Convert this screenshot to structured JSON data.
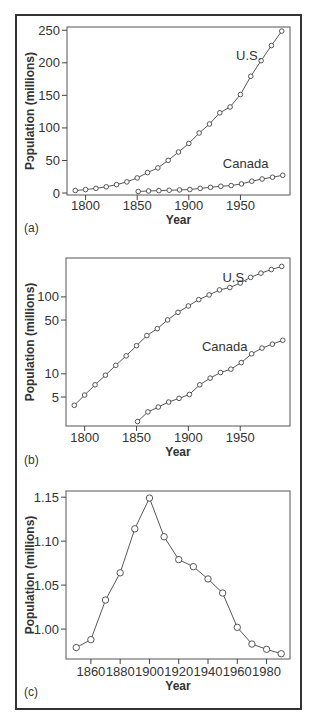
{
  "figure": {
    "panels": [
      "(a)",
      "(b)",
      "(c)"
    ]
  },
  "chart_data": [
    {
      "id": "a",
      "type": "line",
      "panel_label": "(a)",
      "xlabel": "Year",
      "ylabel": "Population (millions)",
      "ylabel_rendered": "Pɔpulation (millions)",
      "yscale": "linear",
      "xlim": [
        1782,
        1998
      ],
      "ylim": [
        -3,
        255
      ],
      "xticks": [
        1800,
        1850,
        1900,
        1950
      ],
      "yticks": [
        0,
        50,
        100,
        150,
        200,
        250
      ],
      "grid": false,
      "series": [
        {
          "name": "U.S.",
          "label_pos": [
            1958,
            205
          ],
          "x": [
            1790,
            1800,
            1810,
            1820,
            1830,
            1840,
            1850,
            1860,
            1870,
            1880,
            1890,
            1900,
            1910,
            1920,
            1930,
            1940,
            1950,
            1960,
            1970,
            1980,
            1990
          ],
          "values": [
            3.9,
            5.3,
            7.2,
            9.6,
            12.9,
            17.1,
            23.2,
            31.4,
            38.6,
            50.2,
            63.0,
            76.2,
            92.2,
            106.0,
            123.2,
            132.2,
            151.3,
            179.3,
            203.3,
            226.5,
            248.7
          ]
        },
        {
          "name": "Canada",
          "label_pos": [
            1955,
            38
          ],
          "x": [
            1851,
            1861,
            1871,
            1881,
            1891,
            1901,
            1911,
            1921,
            1931,
            1941,
            1951,
            1961,
            1971,
            1981,
            1991
          ],
          "values": [
            2.4,
            3.2,
            3.7,
            4.3,
            4.8,
            5.4,
            7.2,
            8.8,
            10.4,
            11.5,
            14.0,
            18.2,
            21.6,
            24.3,
            27.3
          ]
        }
      ]
    },
    {
      "id": "b",
      "type": "line",
      "panel_label": "(b)",
      "xlabel": "Year",
      "ylabel": "Population (millions)",
      "yscale": "log",
      "xlim": [
        1782,
        1998
      ],
      "ylim": [
        2.1,
        320
      ],
      "xticks": [
        1800,
        1850,
        1900,
        1950
      ],
      "yticks": [
        5,
        10,
        50,
        100
      ],
      "grid": false,
      "series": [
        {
          "name": "U.S.",
          "label_pos": [
            1945,
            155
          ],
          "x": [
            1790,
            1800,
            1810,
            1820,
            1830,
            1840,
            1850,
            1860,
            1870,
            1880,
            1890,
            1900,
            1910,
            1920,
            1930,
            1940,
            1950,
            1960,
            1970,
            1980,
            1990
          ],
          "values": [
            3.9,
            5.3,
            7.2,
            9.6,
            12.9,
            17.1,
            23.2,
            31.4,
            38.6,
            50.2,
            63.0,
            76.2,
            92.2,
            106.0,
            123.2,
            132.2,
            151.3,
            179.3,
            203.3,
            226.5,
            248.7
          ]
        },
        {
          "name": "Canada",
          "label_pos": [
            1935,
            20
          ],
          "x": [
            1851,
            1861,
            1871,
            1881,
            1891,
            1901,
            1911,
            1921,
            1931,
            1941,
            1951,
            1961,
            1971,
            1981,
            1991
          ],
          "values": [
            2.4,
            3.2,
            3.7,
            4.3,
            4.8,
            5.4,
            7.2,
            8.8,
            10.4,
            11.5,
            14.0,
            18.2,
            21.6,
            24.3,
            27.3
          ]
        }
      ]
    },
    {
      "id": "c",
      "type": "line",
      "panel_label": "(c)",
      "xlabel": "Year",
      "ylabel": "Population (millions)",
      "yscale": "linear",
      "xlim": [
        1843,
        1996
      ],
      "ylim": [
        0.966,
        1.157
      ],
      "xticks": [
        1860,
        1880,
        1900,
        1920,
        1940,
        1960,
        1980
      ],
      "yticks": [
        1.0,
        1.05,
        1.1,
        1.15
      ],
      "ytick_labels": [
        "1.00",
        "1.05",
        "1.10",
        "1.15"
      ],
      "grid": false,
      "series": [
        {
          "name": "",
          "x": [
            1850,
            1860,
            1870,
            1880,
            1890,
            1900,
            1910,
            1920,
            1930,
            1940,
            1950,
            1960,
            1970,
            1980,
            1990
          ],
          "values": [
            0.979,
            0.988,
            1.033,
            1.064,
            1.114,
            1.149,
            1.105,
            1.079,
            1.071,
            1.057,
            1.041,
            1.002,
            0.983,
            0.977,
            0.972
          ]
        }
      ]
    }
  ]
}
